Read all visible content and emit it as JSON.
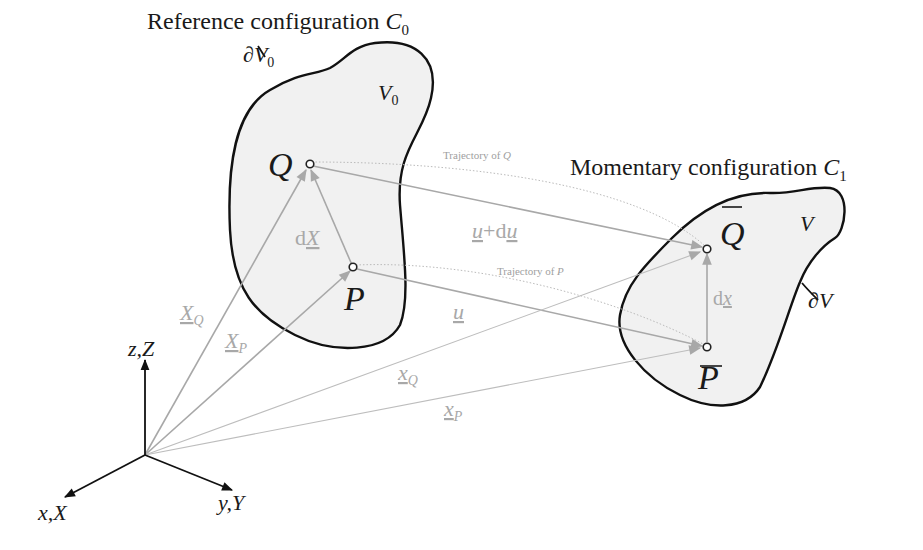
{
  "titles": {
    "reference": {
      "text": "Reference configuration ",
      "symbol": "C",
      "sub": "0"
    },
    "momentary": {
      "text": "Momentary configuration ",
      "symbol": "C",
      "sub": "1"
    }
  },
  "reference_body": {
    "volume": {
      "symbol": "V",
      "sub": "0"
    },
    "boundary": {
      "prefix": "∂",
      "symbol": "V",
      "sub": "0"
    },
    "point_q": "Q",
    "point_p": "P",
    "dX": {
      "prefix": "d",
      "symbol": "X"
    }
  },
  "momentary_body": {
    "volume": {
      "symbol": "V"
    },
    "boundary": {
      "prefix": "∂",
      "symbol": "V"
    },
    "point_q": "Q",
    "point_p": "P",
    "dx": {
      "prefix": "d",
      "symbol": "x"
    }
  },
  "trajectories": {
    "q": {
      "text": "Trajectory of ",
      "symbol": "Q"
    },
    "p": {
      "text": "Trajectory of ",
      "symbol": "P"
    }
  },
  "displacements": {
    "u_plus_du": {
      "u": "u",
      "plus": "+d",
      "du": "u"
    },
    "u": "u"
  },
  "position_vectors": {
    "X_Q": {
      "symbol": "X",
      "sub": "Q"
    },
    "X_P": {
      "symbol": "X",
      "sub": "P"
    },
    "x_Q": {
      "symbol": "x",
      "sub": "Q"
    },
    "x_P": {
      "symbol": "x",
      "sub": "P"
    }
  },
  "axes": {
    "z": "z,Z",
    "x": "x,X",
    "y": "y,Y"
  },
  "colors": {
    "outline": "#111111",
    "fill": "#f1f1f1",
    "vector": "#a8a8a8",
    "text": "#1a1a1a"
  }
}
